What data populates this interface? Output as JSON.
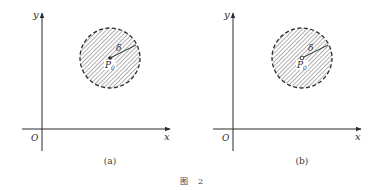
{
  "figure": {
    "caption_prefix": "图",
    "caption_number": "2",
    "colors": {
      "ink": "#2b2b2b",
      "hatch": "#6e6e6e",
      "background": "#ffffff"
    },
    "panels": [
      {
        "id": "a",
        "label": "(a)",
        "axes": {
          "x_label": "x",
          "y_label": "y",
          "origin_label": "O"
        },
        "neighborhood": {
          "center_label": "P",
          "center_subscript": "0",
          "radius_label": "δ",
          "center_point": "filled",
          "boundary": "dashed",
          "interior": "hatched"
        }
      },
      {
        "id": "b",
        "label": "(b)",
        "axes": {
          "x_label": "x",
          "y_label": "y",
          "origin_label": "O"
        },
        "neighborhood": {
          "center_label": "P",
          "center_subscript": "0",
          "radius_label": "δ",
          "center_point": "hollow",
          "boundary": "dashed",
          "interior": "hatched"
        }
      }
    ]
  }
}
